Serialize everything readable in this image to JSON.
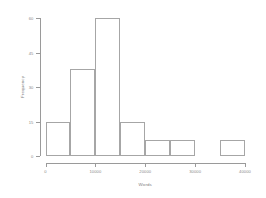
{
  "chart_data": {
    "type": "bar",
    "title": "",
    "xlabel": "Words",
    "ylabel": "Frequency",
    "categories": [
      "0-5000",
      "5000-10000",
      "10000-15000",
      "15000-20000",
      "20000-25000",
      "25000-30000",
      "30000-35000",
      "35000-40000"
    ],
    "bin_edges": [
      0,
      5000,
      10000,
      15000,
      20000,
      25000,
      30000,
      35000,
      40000
    ],
    "bin_width": 5000,
    "values": [
      15,
      38,
      60,
      15,
      7,
      7,
      0,
      7
    ],
    "xlim": [
      0,
      40000
    ],
    "ylim": [
      0,
      60
    ],
    "xticks": [
      0,
      10000,
      20000,
      30000,
      40000
    ],
    "xtick_labels": [
      "0",
      "10000",
      "20000",
      "30000",
      "40000"
    ],
    "yticks": [
      0,
      15,
      30,
      45,
      60
    ],
    "ytick_labels": [
      "0",
      "15",
      "30",
      "45",
      "60"
    ],
    "grid": false,
    "legend": false,
    "bar_edge_color": "#a6a6a6",
    "bar_fill_color": "transparent",
    "axis_color": "#9a9a9a",
    "text_color": "#8a8a8a",
    "background": "#ffffff"
  }
}
